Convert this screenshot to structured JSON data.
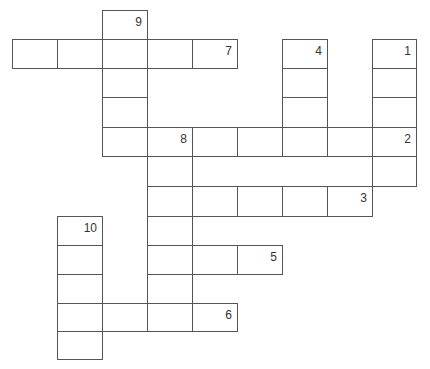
{
  "puzzle": {
    "type": "crossword",
    "col_edges": [
      12,
      57,
      102,
      147,
      192,
      237,
      282,
      327,
      372,
      416
    ],
    "row_edges": [
      10,
      39,
      68,
      97,
      127,
      156,
      186,
      216,
      245,
      274,
      303,
      331,
      359
    ],
    "cells": [
      {
        "r": 0,
        "c": 2,
        "num": "9"
      },
      {
        "r": 1,
        "c": 0
      },
      {
        "r": 1,
        "c": 1
      },
      {
        "r": 1,
        "c": 2
      },
      {
        "r": 1,
        "c": 3
      },
      {
        "r": 1,
        "c": 4,
        "num": "7"
      },
      {
        "r": 1,
        "c": 6,
        "num": "4"
      },
      {
        "r": 1,
        "c": 8,
        "num": "1"
      },
      {
        "r": 2,
        "c": 2
      },
      {
        "r": 2,
        "c": 6
      },
      {
        "r": 2,
        "c": 8
      },
      {
        "r": 3,
        "c": 2
      },
      {
        "r": 3,
        "c": 6
      },
      {
        "r": 3,
        "c": 8
      },
      {
        "r": 4,
        "c": 2
      },
      {
        "r": 4,
        "c": 3,
        "num": "8"
      },
      {
        "r": 4,
        "c": 4
      },
      {
        "r": 4,
        "c": 5
      },
      {
        "r": 4,
        "c": 6
      },
      {
        "r": 4,
        "c": 7
      },
      {
        "r": 4,
        "c": 8,
        "num": "2"
      },
      {
        "r": 5,
        "c": 3
      },
      {
        "r": 5,
        "c": 8
      },
      {
        "r": 6,
        "c": 3
      },
      {
        "r": 6,
        "c": 4
      },
      {
        "r": 6,
        "c": 5
      },
      {
        "r": 6,
        "c": 6
      },
      {
        "r": 6,
        "c": 7,
        "num": "3"
      },
      {
        "r": 7,
        "c": 1,
        "num": "10"
      },
      {
        "r": 7,
        "c": 3
      },
      {
        "r": 8,
        "c": 1
      },
      {
        "r": 8,
        "c": 3
      },
      {
        "r": 8,
        "c": 4
      },
      {
        "r": 8,
        "c": 5,
        "num": "5"
      },
      {
        "r": 9,
        "c": 1
      },
      {
        "r": 9,
        "c": 3
      },
      {
        "r": 10,
        "c": 1
      },
      {
        "r": 10,
        "c": 2
      },
      {
        "r": 10,
        "c": 3
      },
      {
        "r": 10,
        "c": 4,
        "num": "6"
      },
      {
        "r": 11,
        "c": 1
      }
    ],
    "clue_numbers": [
      "1",
      "2",
      "3",
      "4",
      "5",
      "6",
      "7",
      "8",
      "9",
      "10"
    ]
  }
}
